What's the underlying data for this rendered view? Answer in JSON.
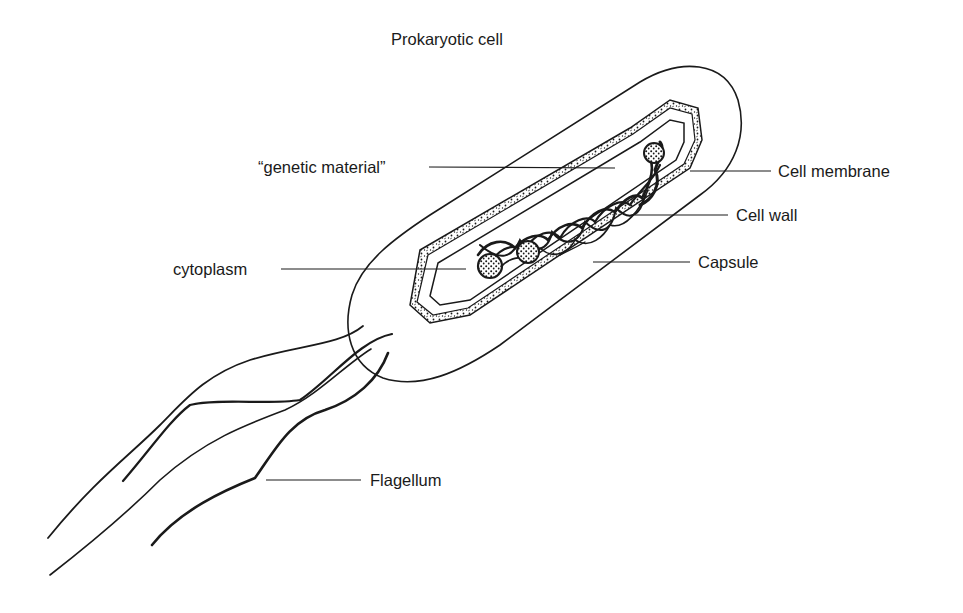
{
  "diagram": {
    "title": "Prokaryotic cell",
    "labels": {
      "genetic_material": "“genetic material”",
      "cell_membrane": "Cell membrane",
      "cell_wall": "Cell wall",
      "cytoplasm": "cytoplasm",
      "capsule": "Capsule",
      "flagellum": "Flagellum"
    },
    "colors": {
      "ink": "#1a1a1a",
      "background": "#ffffff"
    }
  }
}
